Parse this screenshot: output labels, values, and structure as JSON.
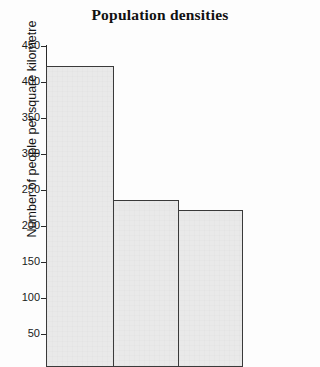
{
  "chart_data": {
    "type": "bar",
    "title": "Population densities",
    "xlabel": "",
    "ylabel": "Number of people per square kilometre",
    "categories": [
      "",
      "",
      ""
    ],
    "values": [
      422,
      236,
      222
    ],
    "ylim": [
      0,
      450
    ],
    "ytick_labels": [
      "450",
      "400",
      "350",
      "300",
      "250",
      "200",
      "150",
      "100",
      "50"
    ],
    "ytick_values": [
      450,
      400,
      350,
      300,
      250,
      200,
      150,
      100,
      50
    ],
    "grid": false,
    "legend": "none",
    "bar_fill_color": "#e9e9e9",
    "bar_border_color": "#3a3a3a",
    "axis_color": "#2a2a2a",
    "background_color": "#fdfdfd"
  }
}
